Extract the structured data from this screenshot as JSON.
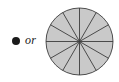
{
  "figure": {
    "bullet": {
      "icon": "bullet-dot-icon",
      "color": "#1a1a1a"
    },
    "connector_text": "or",
    "pie": {
      "label": "circle-divided-into-twelve-equal-sectors",
      "fill_color": "#c9c9c9",
      "stroke_color": "#3c3c3c",
      "center_x": 34.5,
      "center_y": 34.5,
      "radius": 33.5,
      "sector_count": 12,
      "sector_angle_degrees": 30,
      "start_angle_degrees": 0,
      "spoke_angles_degrees": [
        0,
        30,
        60,
        90,
        120,
        150,
        180,
        210,
        240,
        270,
        300,
        330
      ],
      "shaded_sectors": 12,
      "stroke_width": 0.9
    }
  },
  "chart_data": {
    "type": "pie",
    "title": "",
    "categories": [
      "1",
      "2",
      "3",
      "4",
      "5",
      "6",
      "7",
      "8",
      "9",
      "10",
      "11",
      "12"
    ],
    "values": [
      1,
      1,
      1,
      1,
      1,
      1,
      1,
      1,
      1,
      1,
      1,
      1
    ],
    "value_unit": "twelfth",
    "total": 12,
    "slice_fraction": "1/12",
    "slice_degrees": 30,
    "colors": [
      "#c9c9c9"
    ],
    "legend": "none",
    "grid": false,
    "xlabel": "",
    "ylabel": "",
    "annotations": [
      "or"
    ]
  }
}
